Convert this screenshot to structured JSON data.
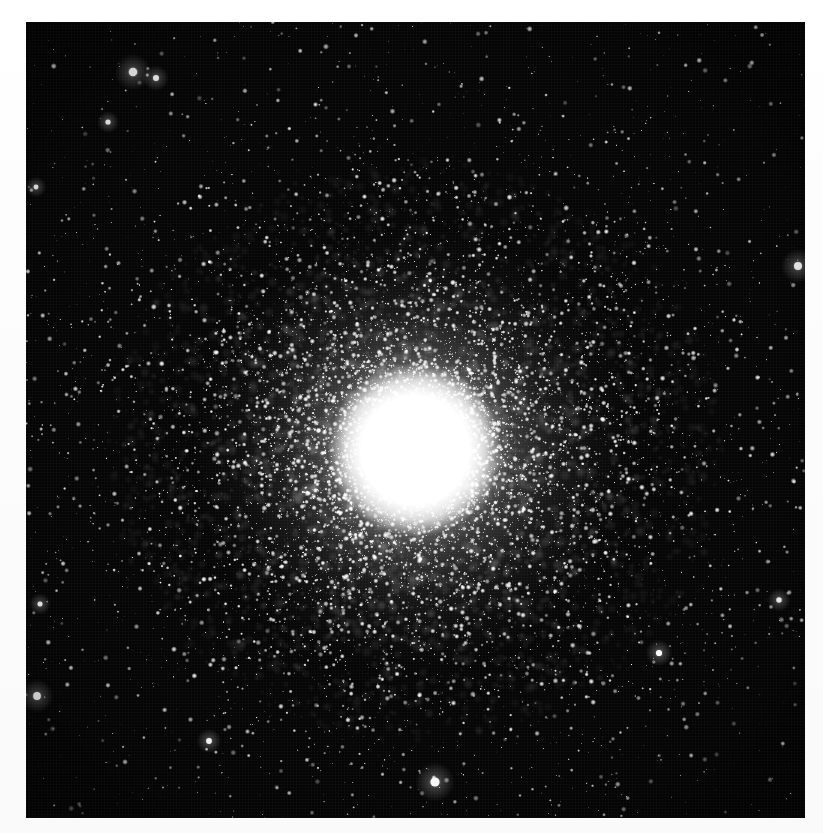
{
  "image": {
    "kind": "astrophotograph",
    "subject_name": "globular-star-cluster",
    "medium": "black-and-white photographic plate scan",
    "caption": "",
    "canvas": {
      "width": 823,
      "height": 833
    },
    "paper_color": "#fdfdfd",
    "plate": {
      "x": 26,
      "y": 22,
      "width": 779,
      "height": 796,
      "sky_color": "#050505",
      "highlight_color": "#ffffff"
    },
    "cluster": {
      "center_x": 415,
      "center_y": 450,
      "saturated_core_radius": 68,
      "bright_inner_radius": 135,
      "halo_radius": 300,
      "outer_extent_radius": 420,
      "core_glow_radius": 230
    },
    "star_counts": {
      "cluster_members": 9000,
      "field_stars": 1500,
      "bright_field_stars": 11
    },
    "bright_field_stars": [
      {
        "x": 133,
        "y": 72,
        "radius": 6.0,
        "name": "bright-star-upper-left"
      },
      {
        "x": 156,
        "y": 78,
        "radius": 4.2,
        "name": "bright-star-upper-left-companion"
      },
      {
        "x": 108,
        "y": 122,
        "radius": 3.6,
        "name": "bright-star-left-upper"
      },
      {
        "x": 36,
        "y": 187,
        "radius": 3.4,
        "name": "bright-star-left-edge-upper"
      },
      {
        "x": 798,
        "y": 266,
        "radius": 5.6,
        "name": "bright-star-right-edge"
      },
      {
        "x": 40,
        "y": 604,
        "radius": 3.5,
        "name": "bright-star-left-lower"
      },
      {
        "x": 37,
        "y": 696,
        "radius": 5.4,
        "name": "bright-star-left-edge-lower"
      },
      {
        "x": 435,
        "y": 782,
        "radius": 6.4,
        "name": "bright-star-bottom-center"
      },
      {
        "x": 209,
        "y": 741,
        "radius": 4.0,
        "name": "bright-star-lower-left"
      },
      {
        "x": 659,
        "y": 653,
        "radius": 4.3,
        "name": "bright-star-lower-right"
      },
      {
        "x": 779,
        "y": 600,
        "radius": 3.8,
        "name": "bright-star-right-lower"
      }
    ]
  },
  "chart_data": {
    "type": "scatter",
    "xlabel": "",
    "ylabel": "",
    "x": [
      0,
      30,
      60,
      90,
      120,
      160,
      200,
      250,
      300,
      350,
      400,
      450
    ],
    "radial_density_profile": {
      "radius_px": [
        0,
        30,
        60,
        90,
        120,
        160,
        200,
        250,
        300,
        350,
        400,
        450
      ],
      "relative_surface_density": [
        1.0,
        1.0,
        0.98,
        0.72,
        0.48,
        0.29,
        0.18,
        0.1,
        0.055,
        0.03,
        0.018,
        0.012
      ],
      "ylim": [
        0,
        1
      ]
    },
    "series": [
      {
        "name": "cluster members",
        "values": [
          1.0,
          1.0,
          0.98,
          0.72,
          0.48,
          0.29,
          0.18,
          0.1,
          0.055,
          0.03,
          0.018,
          0.012
        ]
      },
      {
        "name": "field stars",
        "values": [
          0.01,
          0.01,
          0.01,
          0.01,
          0.01,
          0.01,
          0.01,
          0.01,
          0.01,
          0.01,
          0.01,
          0.01
        ]
      }
    ],
    "legend_position": "none",
    "grid": false
  }
}
